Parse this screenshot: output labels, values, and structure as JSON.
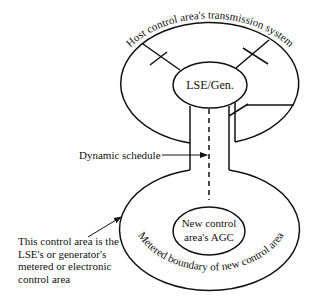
{
  "diagram": {
    "type": "control-area-schematic",
    "labels": {
      "host_system": "Host control area's transmission system",
      "lse_gen": "LSE/Gen.",
      "dynamic_schedule": "Dynamic schedule",
      "new_agc_line1": "New control",
      "new_agc_line2": "area's AGC",
      "metered_boundary": "Metered boundary of new control area",
      "note_line1": "This control area is the",
      "note_line2": "LSE's or generator's",
      "note_line3": "metered or electronic",
      "note_line4": "control area"
    },
    "colors": {
      "stroke": "#111111",
      "background": "#ffffff"
    }
  }
}
